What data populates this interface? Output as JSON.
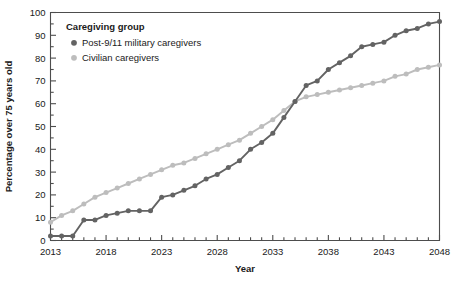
{
  "chart_data": {
    "type": "line",
    "title": "",
    "xlabel": "Year",
    "ylabel": "Percentage over 75 years old",
    "xlim": [
      2013,
      2048
    ],
    "ylim": [
      0,
      100
    ],
    "ytick_step": 10,
    "yminor_step": 5,
    "xtick_step": 1,
    "xlabel_step": 5,
    "grid": false,
    "legend_position": "upper-left-inside",
    "ytick_labels": [
      "0",
      "10",
      "20",
      "30",
      "40",
      "50",
      "60",
      "70",
      "80",
      "90",
      "100"
    ],
    "xtick_labels": [
      "2013",
      "2018",
      "2023",
      "2028",
      "2033",
      "2038",
      "2043",
      "2048"
    ],
    "x": [
      2013,
      2014,
      2015,
      2016,
      2017,
      2018,
      2019,
      2020,
      2021,
      2022,
      2023,
      2024,
      2025,
      2026,
      2027,
      2028,
      2029,
      2030,
      2031,
      2032,
      2033,
      2034,
      2035,
      2036,
      2037,
      2038,
      2039,
      2040,
      2041,
      2042,
      2043,
      2044,
      2045,
      2046,
      2047,
      2048
    ],
    "series": [
      {
        "name": "Post-9/11 military caregivers",
        "color": "#636363",
        "marker": "circle",
        "values": [
          2,
          2,
          2,
          9,
          9,
          11,
          12,
          13,
          13,
          13,
          19,
          20,
          22,
          24,
          27,
          29,
          32,
          35,
          40,
          43,
          47,
          54,
          61,
          68,
          70,
          75,
          78,
          81,
          85,
          86,
          87,
          90,
          92,
          93,
          95,
          96
        ]
      },
      {
        "name": "Civilian caregivers",
        "color": "#bdbdbd",
        "marker": "circle",
        "values": [
          8,
          11,
          13,
          16,
          19,
          21,
          23,
          25,
          27,
          29,
          31,
          33,
          34,
          36,
          38,
          40,
          42,
          44,
          47,
          50,
          53,
          57,
          61,
          63,
          64,
          65,
          66,
          67,
          68,
          69,
          70,
          72,
          73,
          75,
          76,
          77
        ]
      }
    ]
  },
  "legend": {
    "title": "Caregiving group",
    "entries": [
      {
        "label": "Post-9/11 military caregivers",
        "color": "#636363"
      },
      {
        "label": "Civilian caregivers",
        "color": "#bdbdbd"
      }
    ]
  },
  "axes": {
    "x_title": "Year",
    "y_title": "Percentage over 75 years old",
    "axis_color": "#4d4d4d"
  }
}
